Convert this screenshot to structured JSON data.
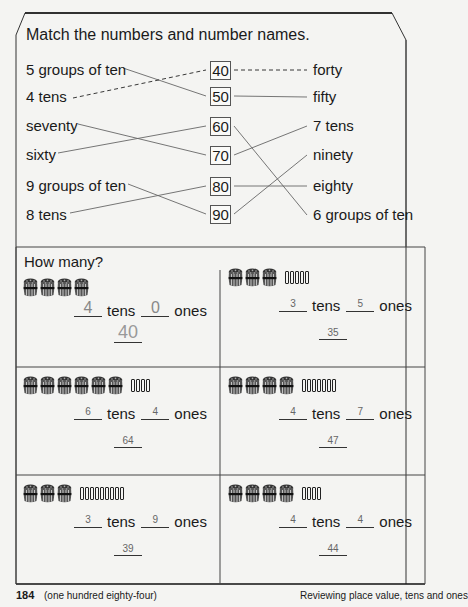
{
  "matching": {
    "title": "Match the numbers and number names.",
    "left_items": [
      "5 groups of ten",
      "4 tens",
      "seventy",
      "sixty",
      "9 groups of ten",
      "8 tens"
    ],
    "numbers": [
      "40",
      "50",
      "60",
      "70",
      "80",
      "90"
    ],
    "right_items": [
      "forty",
      "fifty",
      "7 tens",
      "ninety",
      "eighty",
      "6 groups of ten"
    ],
    "left_connections": [
      {
        "from": "5 groups of ten",
        "to": "50",
        "style": "solid"
      },
      {
        "from": "4 tens",
        "to": "40",
        "style": "dashed"
      },
      {
        "from": "seventy",
        "to": "70",
        "style": "solid"
      },
      {
        "from": "sixty",
        "to": "60",
        "style": "solid"
      },
      {
        "from": "9 groups of ten",
        "to": "90",
        "style": "solid"
      },
      {
        "from": "8 tens",
        "to": "80",
        "style": "solid"
      }
    ],
    "right_connections": [
      {
        "from": "40",
        "to": "forty",
        "style": "dashed"
      },
      {
        "from": "50",
        "to": "fifty",
        "style": "solid"
      },
      {
        "from": "60",
        "to": "6 groups of ten",
        "style": "solid"
      },
      {
        "from": "70",
        "to": "7 tens",
        "style": "solid"
      },
      {
        "from": "80",
        "to": "eighty",
        "style": "solid"
      },
      {
        "from": "90",
        "to": "ninety",
        "style": "solid"
      }
    ]
  },
  "how_many": {
    "title": "How many?",
    "tens_word": "tens",
    "ones_word": "ones",
    "problems": [
      {
        "tens_bundles": 4,
        "ones_sticks": 0,
        "tens_answer": "4",
        "ones_answer": "0",
        "total": "40",
        "example": true
      },
      {
        "tens_bundles": 3,
        "ones_sticks": 5,
        "tens_answer": "3",
        "ones_answer": "5",
        "total": "35",
        "example": false
      },
      {
        "tens_bundles": 6,
        "ones_sticks": 4,
        "tens_answer": "6",
        "ones_answer": "4",
        "total": "64",
        "example": false
      },
      {
        "tens_bundles": 4,
        "ones_sticks": 7,
        "tens_answer": "4",
        "ones_answer": "7",
        "total": "47",
        "example": false
      },
      {
        "tens_bundles": 3,
        "ones_sticks": 9,
        "tens_answer": "3",
        "ones_answer": "9",
        "total": "39",
        "example": false
      },
      {
        "tens_bundles": 4,
        "ones_sticks": 4,
        "tens_answer": "4",
        "ones_answer": "4",
        "total": "44",
        "example": false
      }
    ]
  },
  "footer": {
    "page_number": "184",
    "page_words": "(one hundred eighty-four)",
    "section_title": "Reviewing place value, tens and ones"
  }
}
